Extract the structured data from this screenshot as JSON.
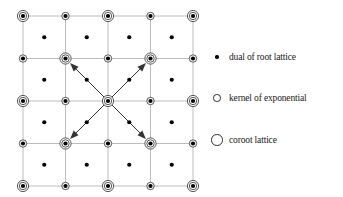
{
  "figure": {
    "background_color": "#ffffff"
  },
  "chart_data": {
    "type": "scatter",
    "title": "",
    "xlabel": "",
    "ylabel": "",
    "grid": true,
    "legend_position": "right",
    "xlim": [
      0,
      4
    ],
    "ylim": [
      0,
      4
    ],
    "geometry": {
      "grid_origin_x": 23,
      "grid_origin_y": 16,
      "cell_size": 42.5,
      "columns": 5,
      "rows": 5,
      "grid_line_color": "#b4b4b4",
      "grid_line_width": 0.9
    },
    "node_pattern": "checkerboard: (row+col) even = coroot-lattice (large ring), odd = kernel-of-exponential (small ring)",
    "nodes": [
      {
        "row": 0,
        "col": 0,
        "type": "coroot-lattice"
      },
      {
        "row": 0,
        "col": 1,
        "type": "kernel-of-exponential"
      },
      {
        "row": 0,
        "col": 2,
        "type": "coroot-lattice"
      },
      {
        "row": 0,
        "col": 3,
        "type": "kernel-of-exponential"
      },
      {
        "row": 0,
        "col": 4,
        "type": "coroot-lattice"
      },
      {
        "row": 1,
        "col": 0,
        "type": "kernel-of-exponential"
      },
      {
        "row": 1,
        "col": 1,
        "type": "coroot-lattice"
      },
      {
        "row": 1,
        "col": 2,
        "type": "kernel-of-exponential"
      },
      {
        "row": 1,
        "col": 3,
        "type": "coroot-lattice"
      },
      {
        "row": 1,
        "col": 4,
        "type": "kernel-of-exponential"
      },
      {
        "row": 2,
        "col": 0,
        "type": "coroot-lattice"
      },
      {
        "row": 2,
        "col": 1,
        "type": "kernel-of-exponential"
      },
      {
        "row": 2,
        "col": 2,
        "type": "coroot-lattice"
      },
      {
        "row": 2,
        "col": 3,
        "type": "kernel-of-exponential"
      },
      {
        "row": 2,
        "col": 4,
        "type": "coroot-lattice"
      },
      {
        "row": 3,
        "col": 0,
        "type": "kernel-of-exponential"
      },
      {
        "row": 3,
        "col": 1,
        "type": "coroot-lattice"
      },
      {
        "row": 3,
        "col": 2,
        "type": "kernel-of-exponential"
      },
      {
        "row": 3,
        "col": 3,
        "type": "coroot-lattice"
      },
      {
        "row": 3,
        "col": 4,
        "type": "kernel-of-exponential"
      },
      {
        "row": 4,
        "col": 0,
        "type": "coroot-lattice"
      },
      {
        "row": 4,
        "col": 1,
        "type": "kernel-of-exponential"
      },
      {
        "row": 4,
        "col": 2,
        "type": "coroot-lattice"
      },
      {
        "row": 4,
        "col": 3,
        "type": "kernel-of-exponential"
      },
      {
        "row": 4,
        "col": 4,
        "type": "coroot-lattice"
      }
    ],
    "interstitial_dots": {
      "type": "dual-of-root-lattice",
      "positions": [
        {
          "row": 0.5,
          "col": 0.5
        },
        {
          "row": 0.5,
          "col": 1.5
        },
        {
          "row": 0.5,
          "col": 2.5
        },
        {
          "row": 0.5,
          "col": 3.5
        },
        {
          "row": 1.5,
          "col": 0.5
        },
        {
          "row": 1.5,
          "col": 1.5
        },
        {
          "row": 1.5,
          "col": 2.5
        },
        {
          "row": 1.5,
          "col": 3.5
        },
        {
          "row": 2.5,
          "col": 0.5
        },
        {
          "row": 2.5,
          "col": 1.5
        },
        {
          "row": 2.5,
          "col": 2.5
        },
        {
          "row": 2.5,
          "col": 3.5
        },
        {
          "row": 3.5,
          "col": 0.5
        },
        {
          "row": 3.5,
          "col": 1.5
        },
        {
          "row": 3.5,
          "col": 2.5
        },
        {
          "row": 3.5,
          "col": 3.5
        }
      ]
    },
    "arrows": {
      "origin": {
        "row": 2,
        "col": 2
      },
      "color": "#333333",
      "vectors": [
        {
          "name": "arrow-up-right",
          "to_row": 1,
          "to_col": 3
        },
        {
          "name": "arrow-up-left",
          "to_row": 1,
          "to_col": 1
        },
        {
          "name": "arrow-down-left",
          "to_row": 3,
          "to_col": 1
        },
        {
          "name": "arrow-down-right",
          "to_row": 3,
          "to_col": 3
        }
      ]
    },
    "legend": [
      {
        "marker": "small-filled-dot",
        "label": "dual of root lattice"
      },
      {
        "marker": "medium-open-circle",
        "label": "kernel of exponential"
      },
      {
        "marker": "large-open-circle",
        "label": "coroot lattice"
      }
    ]
  }
}
